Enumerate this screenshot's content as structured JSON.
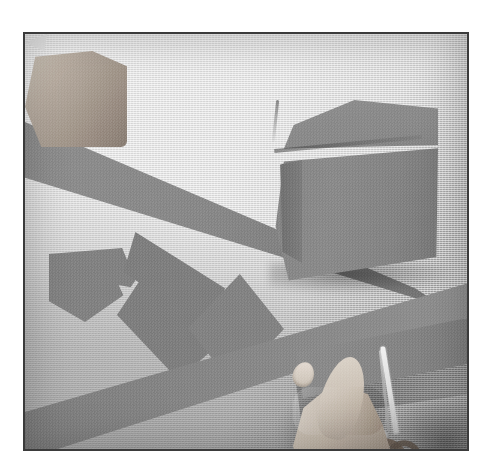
{
  "scene": {
    "title": "Cutting paper strips for gift wrapping",
    "medium": "black-and-white photograph",
    "caption_text": "",
    "border_color": "#3b3b3b",
    "page_background": "#ffffff"
  },
  "photo": {
    "frame": {
      "left": 23,
      "top": 32,
      "width": 446,
      "height": 419,
      "border_width": 2
    },
    "surface": {
      "name": "work-surface",
      "description": "light textured table top",
      "color_light": "#e6e6e6",
      "color_shadow": "#9a9a9a"
    },
    "objects": [
      {
        "name": "gift-box",
        "label": "wrapped cube gift box",
        "color": "#888888",
        "faces": [
          "top",
          "front",
          "side"
        ]
      },
      {
        "name": "strip-upper",
        "label": "upper diagonal paper strip",
        "color": "#8a8a8a"
      },
      {
        "name": "strip-lower",
        "label": "lower diagonal paper strip",
        "color": "#868686"
      },
      {
        "name": "strip-cutting",
        "label": "paper strip being cut",
        "color": "#868686"
      },
      {
        "name": "cut-pieces",
        "label": "cut paper squares",
        "color": "#818181",
        "count": 3
      },
      {
        "name": "hand-left",
        "label": "left hand holding paper",
        "skin_color": "#c3b8ac"
      },
      {
        "name": "hand-right",
        "label": "right hand gripping scissors",
        "skin_color": "#b5aa9e"
      },
      {
        "name": "scissors",
        "label": "scissors cutting the strip",
        "blade_color": "#e4e4e4",
        "handle_color": "#6a5e55"
      }
    ]
  },
  "palette": {
    "paper_gray": "#888888",
    "table_light": "#e6e6e6",
    "table_dark": "#9a9a9a",
    "skin": "#c3b8ac",
    "frame": "#3b3b3b"
  }
}
